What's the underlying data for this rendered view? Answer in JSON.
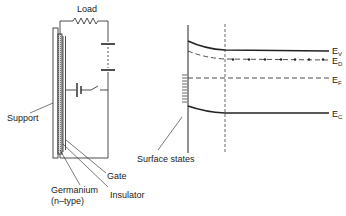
{
  "left_panel": {
    "title": "Field-effect device circuit",
    "labels": {
      "load": "Load",
      "support": "Support",
      "gate": "Gate",
      "germanium": "Germanium",
      "germanium_type": "(n–type)",
      "insulator": "Insulator"
    }
  },
  "right_panel": {
    "title": "Energy band diagram",
    "labels": {
      "surface_states": "Surface states",
      "ev_main": "E",
      "ev_sub": "V",
      "ed_main": "E",
      "ed_sub": "D",
      "ef_main": "E",
      "ef_sub": "F",
      "ec_main": "E",
      "ec_sub": "C"
    }
  },
  "colors": {
    "line": "#222222",
    "background": "#ffffff"
  }
}
